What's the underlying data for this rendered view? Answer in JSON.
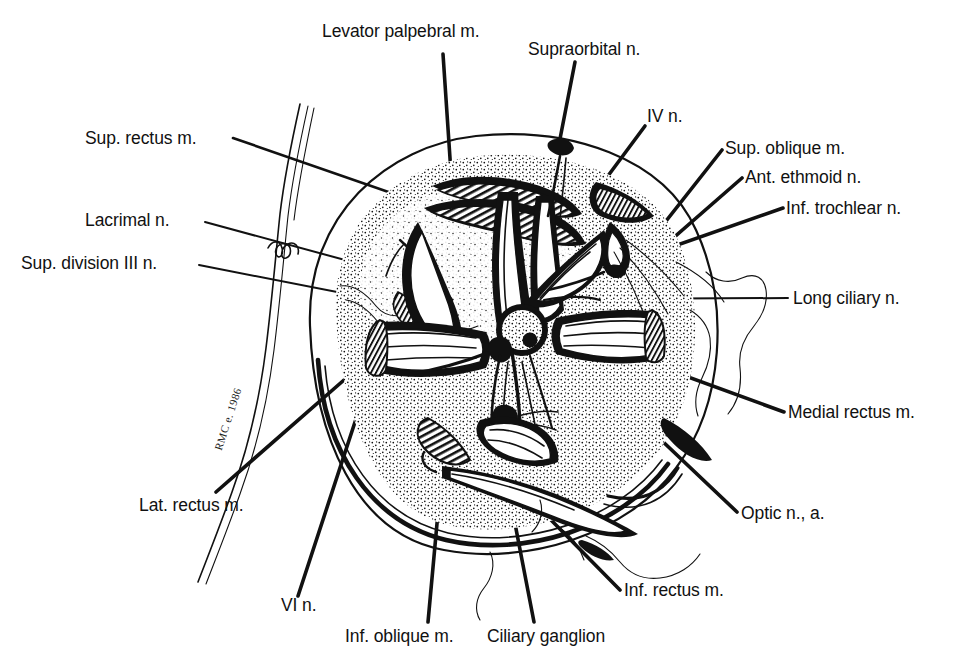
{
  "figure": {
    "ink_color": "#111111",
    "background_color": "#ffffff",
    "width": 953,
    "height": 663,
    "signature": "RMC e. 1986"
  },
  "labels": {
    "levator_palpebral": "Levator palpebral m.",
    "supraorbital": "Supraorbital n.",
    "iv_n": "IV n.",
    "sup_oblique": "Sup. oblique m.",
    "ant_ethmoid": "Ant. ethmoid n.",
    "inf_trochlear": "Inf. trochlear n.",
    "long_ciliary": "Long ciliary n.",
    "medial_rectus": "Medial rectus m.",
    "optic": "Optic n., a.",
    "inf_rectus": "Inf. rectus m.",
    "ciliary_ganglion": "Ciliary ganglion",
    "inf_oblique": "Inf. oblique m.",
    "vi_n": "VI n.",
    "lat_rectus": "Lat. rectus m.",
    "sup_division_iii": "Sup. division III n.",
    "lacrimal": "Lacrimal n.",
    "sup_rectus": "Sup. rectus m."
  }
}
